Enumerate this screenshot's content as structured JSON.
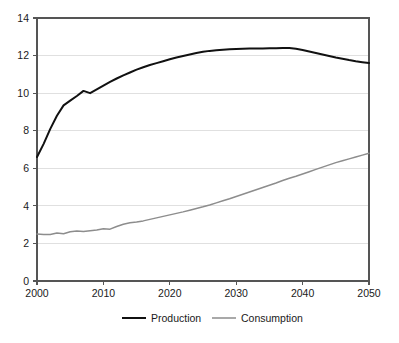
{
  "chart_data": {
    "type": "line",
    "title": "",
    "subtitle": "",
    "xlabel": "",
    "ylabel": "",
    "xlim": [
      2000,
      2050
    ],
    "ylim": [
      0,
      14
    ],
    "grid": "horizontal",
    "legend_position": "bottom-center",
    "x_ticks": [
      2000,
      2010,
      2020,
      2030,
      2040,
      2050
    ],
    "x_tick_labels": [
      "2000",
      "2010",
      "2020",
      "2030",
      "2040",
      "2050"
    ],
    "y_ticks": [
      0,
      2,
      4,
      6,
      8,
      10,
      12,
      14
    ],
    "y_tick_labels": [
      "0",
      "2",
      "4",
      "6",
      "8",
      "10",
      "12",
      "14"
    ],
    "colors": {
      "production": "#111111",
      "consumption": "#8d8d8d",
      "gridline": "#d8d8d8",
      "axis": "#555555",
      "background": "#ffffff"
    },
    "x": [
      2000,
      2001,
      2002,
      2003,
      2004,
      2005,
      2006,
      2007,
      2008,
      2009,
      2010,
      2011,
      2012,
      2013,
      2014,
      2015,
      2016,
      2017,
      2018,
      2019,
      2020,
      2021,
      2022,
      2023,
      2024,
      2025,
      2026,
      2027,
      2028,
      2029,
      2030,
      2031,
      2032,
      2033,
      2034,
      2035,
      2036,
      2037,
      2038,
      2039,
      2040,
      2041,
      2042,
      2043,
      2044,
      2045,
      2046,
      2047,
      2048,
      2049,
      2050
    ],
    "series": [
      {
        "name": "Production",
        "color": "#111111",
        "values": [
          6.6,
          7.3,
          8.1,
          8.8,
          9.35,
          9.6,
          9.85,
          10.12,
          10.0,
          10.2,
          10.4,
          10.6,
          10.78,
          10.95,
          11.1,
          11.25,
          11.38,
          11.5,
          11.6,
          11.7,
          11.8,
          11.9,
          11.98,
          12.06,
          12.14,
          12.2,
          12.25,
          12.28,
          12.31,
          12.33,
          12.35,
          12.36,
          12.37,
          12.38,
          12.38,
          12.39,
          12.39,
          12.4,
          12.4,
          12.36,
          12.3,
          12.22,
          12.14,
          12.06,
          11.98,
          11.9,
          11.83,
          11.76,
          11.7,
          11.65,
          11.6
        ]
      },
      {
        "name": "Consumption",
        "color": "#8d8d8d",
        "values": [
          2.5,
          2.48,
          2.47,
          2.55,
          2.52,
          2.62,
          2.66,
          2.64,
          2.68,
          2.72,
          2.78,
          2.76,
          2.9,
          3.02,
          3.1,
          3.14,
          3.2,
          3.28,
          3.36,
          3.44,
          3.52,
          3.6,
          3.68,
          3.77,
          3.86,
          3.95,
          4.05,
          4.16,
          4.27,
          4.38,
          4.5,
          4.62,
          4.74,
          4.86,
          4.98,
          5.1,
          5.22,
          5.35,
          5.47,
          5.58,
          5.7,
          5.82,
          5.94,
          6.06,
          6.18,
          6.3,
          6.4,
          6.5,
          6.6,
          6.7,
          6.8
        ]
      }
    ],
    "annotations": []
  },
  "legend": {
    "items": [
      {
        "label": "Production",
        "color": "#111111"
      },
      {
        "label": "Consumption",
        "color": "#8d8d8d"
      }
    ]
  }
}
